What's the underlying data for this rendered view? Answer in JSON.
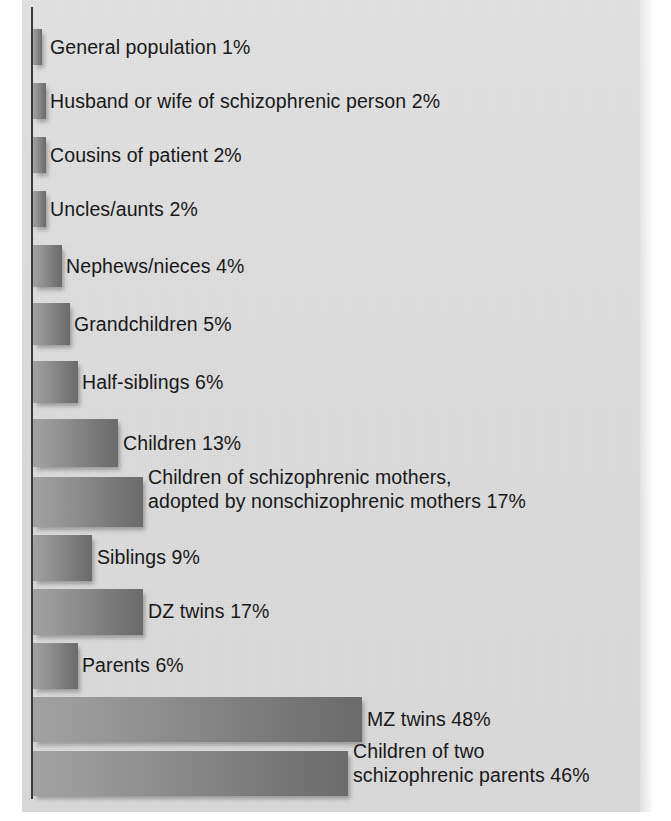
{
  "figure": {
    "kind": "horizontal-bar-chart",
    "panel_background": "#dcdcdc",
    "bar_color_light": "#a2a2a2",
    "bar_color_dark": "#6b6b6b",
    "axis_color": "#3a3a3a",
    "text_color": "#181818"
  },
  "chart_data": {
    "type": "bar",
    "orientation": "horizontal",
    "title": "",
    "subtitle": "",
    "xlabel": "",
    "ylabel": "",
    "xlim": [
      0,
      48
    ],
    "grid": false,
    "legend": null,
    "value_suffix": "%",
    "categories": [
      "General population",
      "Husband or wife of schizophrenic person",
      "Cousins of patient",
      "Uncles/aunts",
      "Nephews/nieces",
      "Grandchildren",
      "Half-siblings",
      "Children",
      "Children of schizophrenic mothers, adopted by nonschizophrenic mothers",
      "Siblings",
      "DZ twins",
      "Parents",
      "MZ twins",
      "Children of two schizophrenic parents"
    ],
    "values": [
      1,
      2,
      2,
      2,
      4,
      5,
      6,
      13,
      17,
      9,
      17,
      6,
      48,
      46
    ]
  },
  "bars": [
    {
      "label": "General population 1%",
      "label_lines": "General population 1%",
      "value": 1,
      "unit": "%"
    },
    {
      "label": "Husband or wife of schizophrenic person 2%",
      "label_lines": "Husband or wife of schizophrenic person 2%",
      "value": 2,
      "unit": "%"
    },
    {
      "label": "Cousins of patient 2%",
      "label_lines": "Cousins of patient 2%",
      "value": 2,
      "unit": "%"
    },
    {
      "label": "Uncles/aunts 2%",
      "label_lines": "Uncles/aunts 2%",
      "value": 2,
      "unit": "%"
    },
    {
      "label": "Nephews/nieces 4%",
      "label_lines": "Nephews/nieces 4%",
      "value": 4,
      "unit": "%"
    },
    {
      "label": "Grandchildren 5%",
      "label_lines": "Grandchildren 5%",
      "value": 5,
      "unit": "%"
    },
    {
      "label": "Half-siblings 6%",
      "label_lines": "Half-siblings 6%",
      "value": 6,
      "unit": "%"
    },
    {
      "label": "Children 13%",
      "label_lines": "Children 13%",
      "value": 13,
      "unit": "%"
    },
    {
      "label": "Children of schizophrenic mothers, adopted by nonschizophrenic mothers 17%",
      "label_lines": "Children of schizophrenic mothers,\nadopted by nonschizophrenic mothers 17%",
      "value": 17,
      "unit": "%"
    },
    {
      "label": "Siblings 9%",
      "label_lines": "Siblings 9%",
      "value": 9,
      "unit": "%"
    },
    {
      "label": "DZ twins 17%",
      "label_lines": "DZ twins 17%",
      "value": 17,
      "unit": "%"
    },
    {
      "label": "Parents 6%",
      "label_lines": "Parents 6%",
      "value": 6,
      "unit": "%"
    },
    {
      "label": "MZ twins 48%",
      "label_lines": "MZ twins 48%",
      "value": 48,
      "unit": "%"
    },
    {
      "label": "Children of two schizophrenic parents 46%",
      "label_lines": "Children of two\nschizophrenic parents 46%",
      "value": 46,
      "unit": "%"
    }
  ],
  "layout": {
    "bar_geometry": [
      {
        "top": 29,
        "height": 36,
        "width": 9,
        "label_left": 50,
        "label_top": 36
      },
      {
        "top": 83,
        "height": 36,
        "width": 13,
        "label_left": 50,
        "label_top": 90
      },
      {
        "top": 137,
        "height": 36,
        "width": 13,
        "label_left": 50,
        "label_top": 144
      },
      {
        "top": 191,
        "height": 36,
        "width": 13,
        "label_left": 50,
        "label_top": 198
      },
      {
        "top": 245,
        "height": 42,
        "width": 29,
        "label_left": 66,
        "label_top": 255
      },
      {
        "top": 303,
        "height": 42,
        "width": 37,
        "label_left": 74,
        "label_top": 313
      },
      {
        "top": 361,
        "height": 42,
        "width": 45,
        "label_left": 82,
        "label_top": 371
      },
      {
        "top": 419,
        "height": 48,
        "width": 85,
        "label_left": 123,
        "label_top": 432
      },
      {
        "top": 477,
        "height": 50,
        "width": 110,
        "label_left": 148,
        "label_top": 466
      },
      {
        "top": 535,
        "height": 46,
        "width": 59,
        "label_left": 97,
        "label_top": 546
      },
      {
        "top": 589,
        "height": 46,
        "width": 110,
        "label_left": 148,
        "label_top": 600
      },
      {
        "top": 643,
        "height": 46,
        "width": 45,
        "label_left": 82,
        "label_top": 654
      },
      {
        "top": 697,
        "height": 45,
        "width": 329,
        "label_left": 367,
        "label_top": 708
      },
      {
        "top": 751,
        "height": 45,
        "width": 315,
        "label_left": 353,
        "label_top": 740
      }
    ]
  }
}
